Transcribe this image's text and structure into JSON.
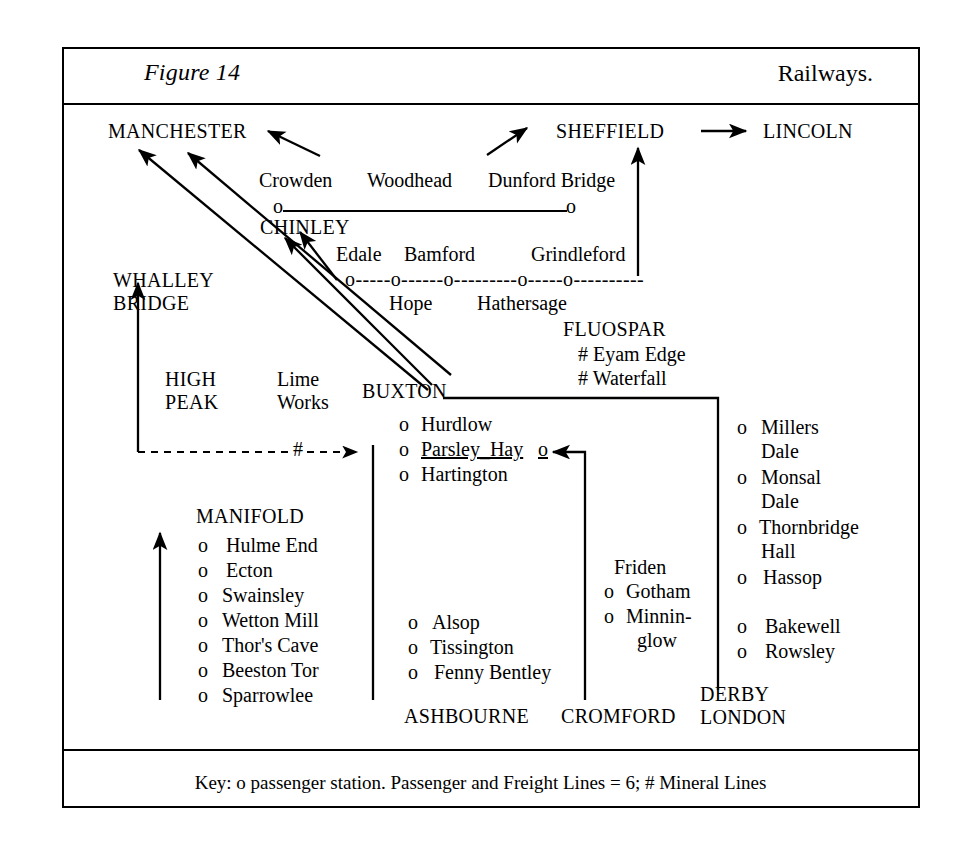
{
  "header": {
    "figure_label": "Figure 14",
    "title": "Railways."
  },
  "key": "Key:   o passenger station.    Passenger and Freight Lines = 6;  # Mineral Lines",
  "terminals": {
    "manchester": "MANCHESTER",
    "sheffield": "SHEFFIELD",
    "lincoln": "LINCOLN",
    "chinley": "CHINLEY",
    "whalley_bridge_line1": "WHALLEY",
    "whalley_bridge_line2": "BRIDGE",
    "buxton": "BUXTON",
    "ashbourne": "ASHBOURNE",
    "cromford": "CROMFORD",
    "derby": "DERBY",
    "london": "LONDON"
  },
  "woodhead_line": {
    "stations": [
      "Crowden",
      "Woodhead",
      "Dunford Bridge"
    ],
    "marker_left": "o",
    "marker_right": "o"
  },
  "hope_valley_line": {
    "above": [
      "Edale",
      "Bamford",
      "Grindleford"
    ],
    "below": [
      "Hope",
      "Hathersage"
    ],
    "markers": "o-----o------o---------o-----o----------"
  },
  "high_peak": {
    "label_line1": "HIGH",
    "label_line2": "PEAK",
    "lime_works_line1": "Lime",
    "lime_works_line2": "Works",
    "mineral_marker": "#"
  },
  "fluospar": {
    "title": "FLUOSPAR",
    "items": [
      "# Eyam Edge",
      "# Waterfall"
    ]
  },
  "buxton_branch": {
    "stations": [
      {
        "marker": "o",
        "name": "Hurdlow",
        "trailing": ""
      },
      {
        "marker": "o",
        "name": "Parsley_Hay",
        "trailing": "o",
        "underline": true
      },
      {
        "marker": "o",
        "name": "Hartington",
        "trailing": ""
      }
    ]
  },
  "manifold": {
    "title": "MANIFOLD",
    "stations": [
      "Hulme End",
      "Ecton",
      "Swainsley",
      "Wetton Mill",
      "Thor's Cave",
      "Beeston Tor",
      "Sparrowlee"
    ],
    "marker": "o"
  },
  "ashbourne_branch": {
    "stations": [
      "Alsop",
      "Tissington",
      "Fenny Bentley"
    ],
    "marker": "o"
  },
  "cromford_branch": {
    "heading": "Friden",
    "stations": [
      "Gotham",
      "Minnin-",
      "glow"
    ],
    "marker": "o"
  },
  "midland_line": {
    "stations": [
      {
        "marker": "o",
        "l1": "Millers",
        "l2": "Dale"
      },
      {
        "marker": "o",
        "l1": "Monsal",
        "l2": "Dale"
      },
      {
        "marker": "o",
        "l1": "Thornbridge",
        "l2": "Hall"
      },
      {
        "marker": "o",
        "l1": "Hassop",
        "l2": ""
      },
      {
        "marker": "o",
        "l1": "Bakewell",
        "l2": ""
      },
      {
        "marker": "o",
        "l1": "Rowsley",
        "l2": ""
      }
    ]
  },
  "colors": {
    "ink": "#000000",
    "paper": "#ffffff"
  }
}
